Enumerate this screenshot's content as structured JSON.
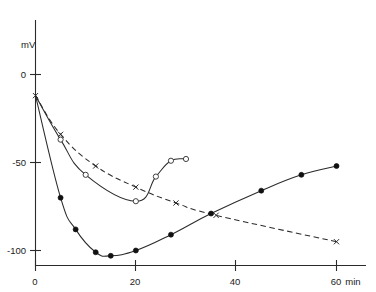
{
  "chart_data": {
    "type": "line",
    "title": "",
    "subtitle": "",
    "xlabel": "min",
    "ylabel": "mV",
    "xlim": [
      -1,
      63
    ],
    "ylim": [
      -112,
      8
    ],
    "grid": false,
    "legend": "none",
    "x_ticks": [
      0,
      20,
      40,
      60
    ],
    "x_tick_labels": [
      "0",
      "20",
      "40",
      "60"
    ],
    "y_ticks": [
      0,
      -50,
      -100
    ],
    "y_tick_labels": [
      "0",
      "-50",
      "-100"
    ],
    "x_unit_label": "min",
    "y_axis_label": "mV",
    "series": [
      {
        "name": "cross-dashed",
        "marker": "cross",
        "line_style": "dashed",
        "x": [
          0,
          5,
          12,
          20,
          28,
          36,
          60
        ],
        "y": [
          -12,
          -34,
          -52,
          -64,
          -73,
          -80,
          -95
        ]
      },
      {
        "name": "open-circle-solid",
        "marker": "open-circle",
        "line_style": "solid",
        "x": [
          0,
          5,
          10,
          20,
          24,
          27,
          30
        ],
        "y": [
          -12,
          -37,
          -57,
          -72,
          -58,
          -49,
          -48
        ]
      },
      {
        "name": "filled-circle-solid",
        "marker": "filled-circle",
        "line_style": "solid",
        "x": [
          0,
          5,
          8,
          12,
          15,
          20,
          27,
          35,
          45,
          53,
          60
        ],
        "y": [
          -12,
          -70,
          -88,
          -101,
          -103,
          -100,
          -91,
          -79,
          -66,
          -57,
          -52
        ]
      }
    ]
  }
}
